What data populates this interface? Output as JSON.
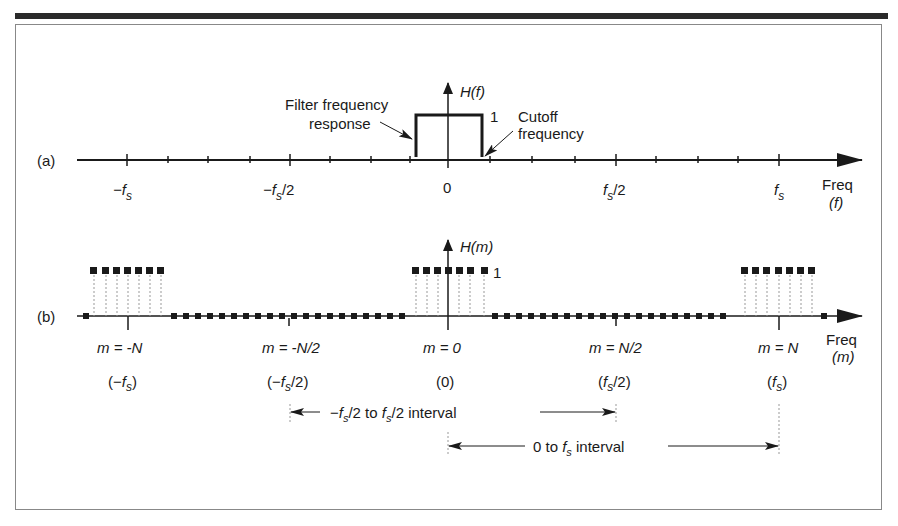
{
  "figure": {
    "panel_a": {
      "label": "(a)",
      "y_axis_label": "H(f)",
      "level_label": "1",
      "annotation_filter": [
        "Filter frequency",
        "response"
      ],
      "annotation_cutoff": [
        "Cutoff",
        "frequency"
      ],
      "x_axis_title": [
        "Freq",
        "(f)"
      ],
      "ticks": [
        "-fs",
        "-fs/2",
        "0",
        "fs/2",
        "fs"
      ]
    },
    "panel_b": {
      "label": "(b)",
      "y_axis_label": "H(m)",
      "level_label": "1",
      "x_axis_title": [
        "Freq",
        "(m)"
      ],
      "ticks": [
        "m = -N",
        "m = -N/2",
        "m = 0",
        "m = N/2",
        "m = N"
      ],
      "tick_freqs": [
        "(-fs)",
        "(-fs/2)",
        "(0)",
        "(fs/2)",
        "(fs)"
      ]
    },
    "intervals": {
      "symmetric": "-fs/2 to fs/2 interval",
      "positive": "0 to fs interval"
    }
  },
  "colors": {
    "ink": "#1a1a1a",
    "frame": "#888888",
    "dotted": "#999999"
  }
}
